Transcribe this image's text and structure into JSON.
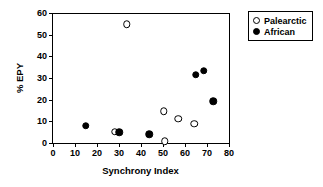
{
  "chart_data": {
    "type": "scatter",
    "title": "",
    "xlabel": "Synchrony Index",
    "ylabel": "% EPY",
    "xlim": [
      0,
      80
    ],
    "ylim": [
      0,
      60
    ],
    "xticks": [
      0,
      10,
      20,
      30,
      40,
      50,
      60,
      70,
      80
    ],
    "yticks": [
      0,
      10,
      20,
      30,
      40,
      50,
      60
    ],
    "xtick_labels": [
      "0",
      "10",
      "20",
      "30",
      "40",
      "50",
      "60",
      "70",
      "80"
    ],
    "ytick_labels": [
      "0",
      "10",
      "20",
      "30",
      "40",
      "50",
      "60"
    ],
    "grid": false,
    "legend_position": "outside-right-top",
    "series": [
      {
        "name": "Palearctic",
        "marker": "open-circle",
        "color": "#000000",
        "fill": "#ffffff",
        "points": [
          {
            "x": 33.5,
            "y": 54.8
          },
          {
            "x": 28.0,
            "y": 5.2
          },
          {
            "x": 50.3,
            "y": 14.6
          },
          {
            "x": 50.8,
            "y": 0.9
          },
          {
            "x": 57.0,
            "y": 11.1
          },
          {
            "x": 64.3,
            "y": 8.8
          }
        ]
      },
      {
        "name": "African",
        "marker": "filled-circle",
        "color": "#000000",
        "fill": "#000000",
        "points": [
          {
            "x": 14.8,
            "y": 8.0
          },
          {
            "x": 30.0,
            "y": 5.0
          },
          {
            "x": 43.8,
            "y": 4.1
          },
          {
            "x": 64.8,
            "y": 31.6
          },
          {
            "x": 68.6,
            "y": 33.4
          },
          {
            "x": 72.8,
            "y": 19.3
          }
        ]
      }
    ]
  },
  "legend": {
    "entries": [
      {
        "label": "Palearctic",
        "marker": "open-circle"
      },
      {
        "label": "African",
        "marker": "filled-circle"
      }
    ]
  }
}
